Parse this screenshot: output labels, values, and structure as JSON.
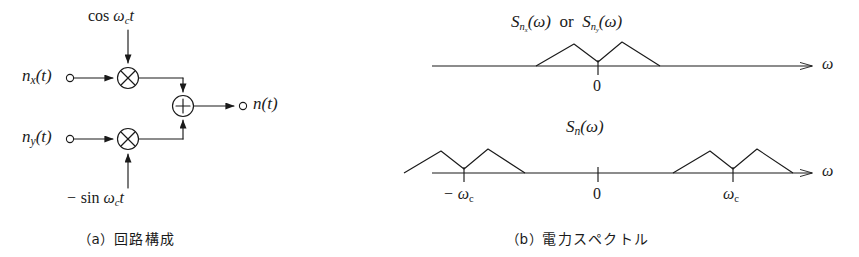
{
  "figure": {
    "panels": [
      {
        "id": "a",
        "caption_index": "（a）",
        "caption_text": "回路構成",
        "inputs": [
          {
            "name": "n_x(t)",
            "html": "n<span class=\"sub\">x</span>(t)"
          },
          {
            "name": "n_y(t)",
            "html": "n<span class=\"sub\">y</span>(t)"
          }
        ],
        "carriers": [
          {
            "name": "cos wc t",
            "html": "<span class=\"upright\">cos</span> ω<span class=\"sub\">c</span>t"
          },
          {
            "name": "minus sin wc t",
            "html": "− <span class=\"upright\">sin</span> ω<span class=\"sub\">c</span>t"
          }
        ],
        "operators": [
          {
            "name": "multiplier-upper",
            "symbol": "×"
          },
          {
            "name": "multiplier-lower",
            "symbol": "×"
          },
          {
            "name": "adder",
            "symbol": "+"
          }
        ],
        "output": {
          "name": "n(t)",
          "html": "n(t)"
        }
      },
      {
        "id": "b",
        "caption_index": "（b）",
        "caption_text": "電力スペクトル",
        "plots": [
          {
            "title_html": "S<span class=\"subsub\">n<span class=\"subsub\">x</span></span>(ω)&nbsp; <span class=\"upright\">or</span> &nbsp;S<span class=\"subsub\">n<span class=\"subsub\">y</span></span>(ω)",
            "title_plain": "S_nx(omega) or S_ny(omega)",
            "axis_label": "ω",
            "ticks": [
              {
                "label": "0",
                "value": 0
              }
            ]
          },
          {
            "title_html": "S<span class=\"sub\">n</span>(ω)",
            "title_plain": "S_n(omega)",
            "axis_label": "ω",
            "ticks": [
              {
                "label_html": "− ω<span class=\"sub-upright\">c</span>",
                "label_plain": "-omega_c",
                "value": -1
              },
              {
                "label_html": "0",
                "label_plain": "0",
                "value": 0
              },
              {
                "label_html": "ω<span class=\"sub-upright\">c</span>",
                "label_plain": "omega_c",
                "value": 1
              }
            ]
          }
        ]
      }
    ]
  },
  "chart_data": [
    {
      "type": "line",
      "name": "baseband-noise-spectrum",
      "title": "S_nx(omega) or S_ny(omega)",
      "xlabel": "ω",
      "ylabel": "",
      "grid": false,
      "legend": "none",
      "xlim": [
        -3.2,
        3.2
      ],
      "ylim": [
        0,
        1
      ],
      "annotations": [
        "0"
      ],
      "series": [
        {
          "name": "baseband M-shaped PSD",
          "x": [
            -1.0,
            -0.5,
            0.0,
            0.5,
            1.0
          ],
          "y": [
            0.0,
            1.0,
            0.12,
            1.0,
            0.0
          ]
        }
      ]
    },
    {
      "type": "line",
      "name": "bandpass-noise-spectrum",
      "title": "S_n(omega)",
      "xlabel": "ω",
      "ylabel": "",
      "grid": false,
      "legend": "none",
      "xlim": [
        -3.2,
        3.2
      ],
      "ylim": [
        0,
        1
      ],
      "annotations": [
        "-ωc",
        "0",
        "ωc"
      ],
      "series": [
        {
          "name": "lower sideband M-shaped PSD at -omega_c",
          "x": [
            -2.0,
            -1.5,
            -1.0,
            -0.5,
            0.0
          ],
          "y": [
            0.0,
            1.0,
            0.12,
            1.0,
            0.0
          ]
        },
        {
          "name": "upper sideband M-shaped PSD at +omega_c",
          "x": [
            0.0,
            0.5,
            1.0,
            1.5,
            2.0
          ],
          "y": [
            0.0,
            1.0,
            0.12,
            1.0,
            0.0
          ]
        }
      ]
    }
  ],
  "colors": {
    "ink": "#1a1a1a",
    "background": "#ffffff"
  }
}
